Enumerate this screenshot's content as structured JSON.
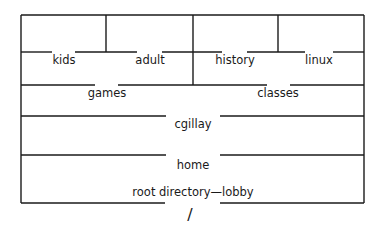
{
  "diagram": {
    "colors": {
      "line": "#1a1a1a",
      "background": "#ffffff"
    },
    "levels": [
      {
        "level": 4,
        "items": [
          {
            "id": "kids",
            "label": "kids"
          },
          {
            "id": "adult",
            "label": "adult"
          },
          {
            "id": "history",
            "label": "history"
          },
          {
            "id": "linux",
            "label": "linux"
          }
        ]
      },
      {
        "level": 3,
        "items": [
          {
            "id": "games",
            "label": "games"
          },
          {
            "id": "classes",
            "label": "classes"
          }
        ]
      },
      {
        "level": 2,
        "items": [
          {
            "id": "cgillay",
            "label": "cgillay"
          }
        ]
      },
      {
        "level": 1,
        "items": [
          {
            "id": "home",
            "label": "home"
          }
        ]
      },
      {
        "level": 0,
        "items": [
          {
            "id": "root",
            "label": "root directory—lobby"
          }
        ]
      }
    ],
    "root_symbol": "/"
  }
}
